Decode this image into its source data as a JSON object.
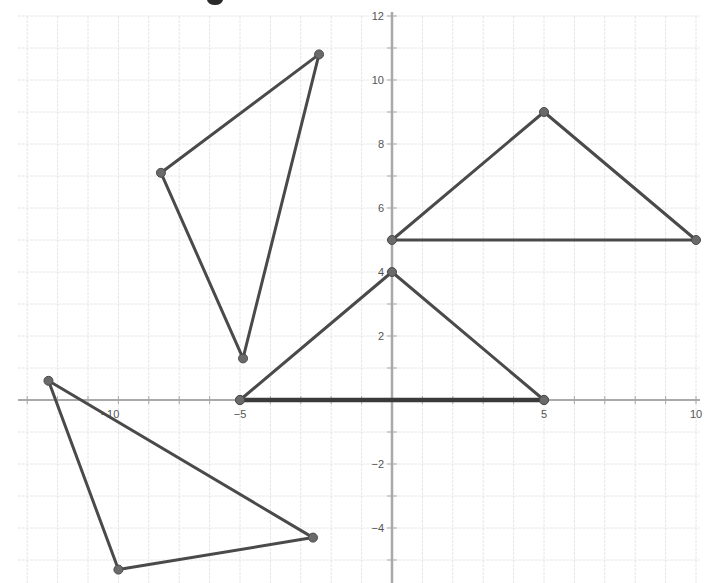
{
  "title_fragment": {
    "visible": "g",
    "note": "descender of heading glyph clipped at top edge"
  },
  "colors": {
    "grid": "#e6e6e6",
    "axis": "#a9a9a9",
    "tick_label": "#555555",
    "shape_stroke": "#4a4a4a",
    "vertex": "#6a6a6a",
    "background": "#ffffff"
  },
  "axes": {
    "x_ticks": [
      {
        "value": -10,
        "label": "−10"
      },
      {
        "value": -5,
        "label": "−5"
      },
      {
        "value": 5,
        "label": "5"
      },
      {
        "value": 10,
        "label": "10"
      }
    ],
    "y_ticks": [
      {
        "value": 12,
        "label": "12"
      },
      {
        "value": 10,
        "label": "10"
      },
      {
        "value": 8,
        "label": "8"
      },
      {
        "value": 6,
        "label": "6"
      },
      {
        "value": 4,
        "label": "4"
      },
      {
        "value": 2,
        "label": "2"
      },
      {
        "value": -2,
        "label": "−2"
      },
      {
        "value": -4,
        "label": "−4"
      }
    ],
    "x_range": [
      -12,
      10
    ],
    "y_range": [
      -5.5,
      12.5
    ],
    "grid_step": 1
  },
  "triangles": [
    {
      "name": "triangle-upper-left",
      "vertices": [
        [
          -2.4,
          10.8
        ],
        [
          -7.6,
          7.1
        ],
        [
          -4.9,
          1.3
        ]
      ]
    },
    {
      "name": "triangle-upper-right",
      "vertices": [
        [
          0,
          5
        ],
        [
          5,
          9
        ],
        [
          10,
          5
        ]
      ]
    },
    {
      "name": "triangle-center",
      "vertices": [
        [
          -5,
          0
        ],
        [
          0,
          4
        ],
        [
          5,
          0
        ]
      ]
    },
    {
      "name": "triangle-lower-left",
      "vertices": [
        [
          -11.3,
          0.6
        ],
        [
          -9,
          -5.3
        ],
        [
          -2.6,
          -4.3
        ]
      ]
    }
  ]
}
